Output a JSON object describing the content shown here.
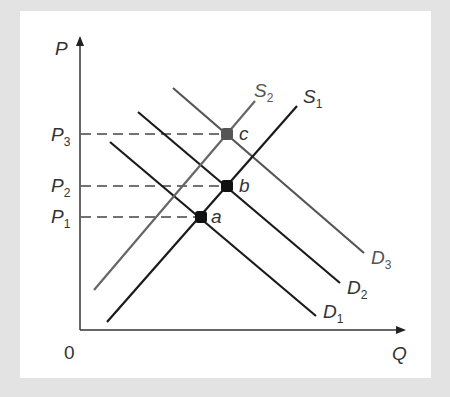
{
  "diagram": {
    "axes": {
      "y_label": "P",
      "x_label": "Q",
      "origin_label": "0"
    },
    "price_levels": [
      {
        "id": "P1",
        "base": "P",
        "sub": "1"
      },
      {
        "id": "P2",
        "base": "P",
        "sub": "2"
      },
      {
        "id": "P3",
        "base": "P",
        "sub": "3"
      }
    ],
    "supply_curves": [
      {
        "id": "S1",
        "base": "S",
        "sub": "1",
        "color": "#1a1a1a"
      },
      {
        "id": "S2",
        "base": "S",
        "sub": "2",
        "color": "#666666"
      }
    ],
    "demand_curves": [
      {
        "id": "D1",
        "base": "D",
        "sub": "1",
        "color": "#1a1a1a"
      },
      {
        "id": "D2",
        "base": "D",
        "sub": "2",
        "color": "#1a1a1a"
      },
      {
        "id": "D3",
        "base": "D",
        "sub": "3",
        "color": "#555555"
      }
    ],
    "points": [
      {
        "id": "a",
        "label": "a",
        "on": [
          "S1",
          "D1"
        ],
        "price": "P1"
      },
      {
        "id": "b",
        "label": "b",
        "on": [
          "S1",
          "D2"
        ],
        "price": "P2"
      },
      {
        "id": "c",
        "label": "c",
        "on": [
          "S2",
          "D3"
        ],
        "price": "P3"
      }
    ]
  }
}
